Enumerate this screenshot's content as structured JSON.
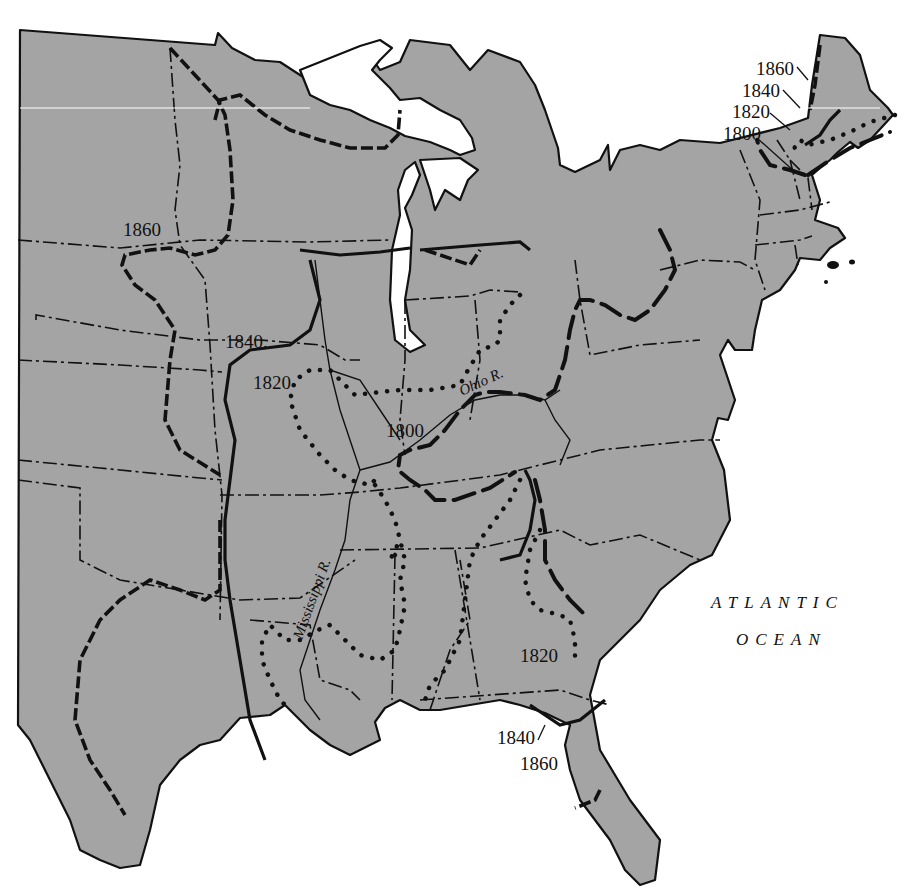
{
  "map": {
    "title": "Frontier lines of the eastern United States, 1800-1860",
    "colors": {
      "land": "#a4a4a4",
      "water": "#ffffff",
      "lines": "#111111"
    },
    "frontier_labels": {
      "west_1860": "1860",
      "west_1840": "1840.",
      "west_1820": "1820",
      "west_1800": "1800",
      "ne_1860": "1860",
      "ne_1840": "1840",
      "ne_1820": "1820",
      "ne_1800": "1800",
      "se_1820": "1820",
      "fl_1840": "1840",
      "fl_1860": "1860"
    },
    "rivers": {
      "ohio": "Ohio R.",
      "mississippi": "Mississippi R."
    },
    "ocean": {
      "line1": "ATLANTIC",
      "line2": "OCEAN"
    },
    "legend_line_styles": [
      {
        "year": "1800",
        "style": "long dashes"
      },
      {
        "year": "1820",
        "style": "dotted"
      },
      {
        "year": "1840",
        "style": "solid"
      },
      {
        "year": "1860",
        "style": "short dashes"
      }
    ]
  }
}
